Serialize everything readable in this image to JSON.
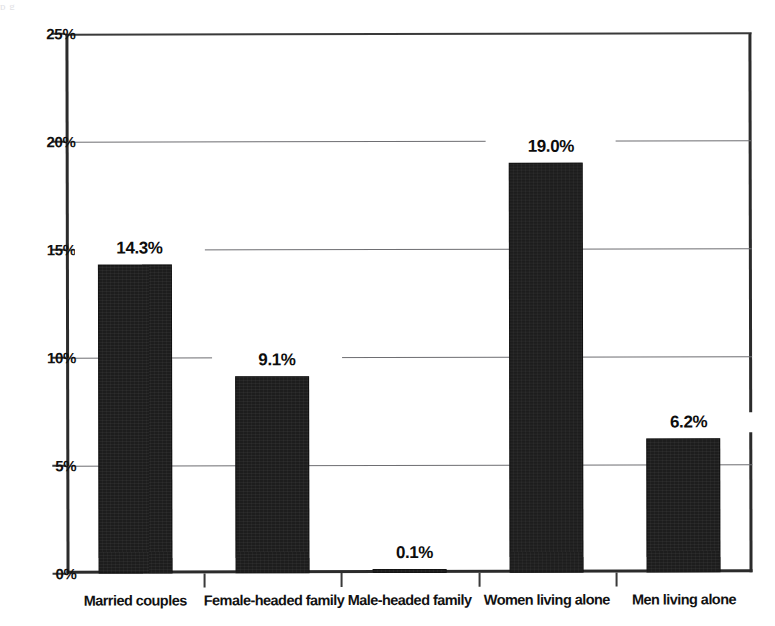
{
  "scan": {
    "top_fragment": "p                g                                                                                  "
  },
  "chart_data": {
    "type": "bar",
    "title": "",
    "subtitle": "",
    "xlabel": "",
    "ylabel": "",
    "categories": [
      "Married couples",
      "Female-headed family",
      "Male-headed family",
      "Women living alone",
      "Men living alone"
    ],
    "values": [
      14.3,
      9.1,
      0.1,
      19.0,
      6.2
    ],
    "data_labels": [
      "14.3%",
      "9.1%",
      "0.1%",
      "19.0%",
      "6.2%"
    ],
    "ylim": [
      0,
      25
    ],
    "ytick_values": [
      0,
      5,
      10,
      15,
      20,
      25
    ],
    "ytick_labels": [
      "0%",
      "5%",
      "10%",
      "15%",
      "20%",
      "25%"
    ],
    "grid": true,
    "legend": false,
    "legend_position": "none",
    "bar_color": "#1d1d1d",
    "gridline_color": "#6e6e72",
    "axis_color": "#2b2b2b",
    "background_color": "#ffffff"
  }
}
